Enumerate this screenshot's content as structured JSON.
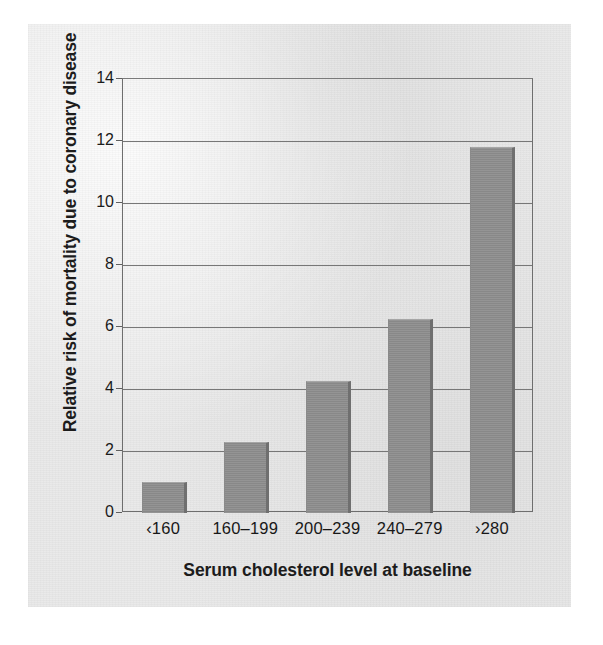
{
  "figure": {
    "background_color": "#e9e9e9",
    "bar_color": "#8e8e8e",
    "axis_color": "#6e6e6e",
    "text_color": "#1b1b1b"
  },
  "chart_data": {
    "type": "bar",
    "title": "",
    "xlabel": "Serum cholesterol level at baseline",
    "ylabel": "Relative risk of mortality due to coronary disease",
    "categories": [
      "‹160",
      "160–199",
      "200–239",
      "240–279",
      "›280"
    ],
    "values": [
      1.0,
      2.3,
      4.25,
      6.25,
      11.8
    ],
    "ylim": [
      0,
      14
    ],
    "yticks": [
      0,
      2,
      4,
      6,
      8,
      10,
      12,
      14
    ],
    "ytick_labels": [
      "0",
      "2",
      "4",
      "6",
      "8",
      "10",
      "12",
      "14"
    ],
    "gridlines": [
      2,
      4,
      6,
      8,
      10,
      12
    ],
    "grid": true,
    "legend": null,
    "legend_position": "none",
    "series": [
      {
        "name": "Relative risk of mortality due to coronary disease",
        "values": [
          1.0,
          2.3,
          4.25,
          6.25,
          11.8
        ]
      }
    ]
  }
}
